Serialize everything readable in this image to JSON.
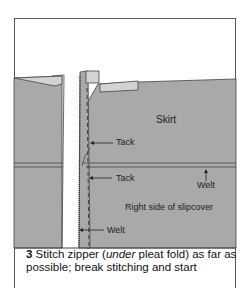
{
  "labels": {
    "skirt": "Skirt",
    "tack_upper": "Tack",
    "tack_lower": "Tack",
    "welt_right": "Welt",
    "right_side": "Right side of slipcover",
    "welt_lower": "Welt"
  },
  "caption": {
    "step_number": "3",
    "text_before": " Stitch zipper (",
    "italic": "under",
    "text_after": " pleat fold) as far as possible; break stitching and start"
  },
  "colors": {
    "fabric": "#a9a9a9",
    "fabric_light": "#cfcfcf",
    "outline": "#444444",
    "background": "#ffffff"
  }
}
